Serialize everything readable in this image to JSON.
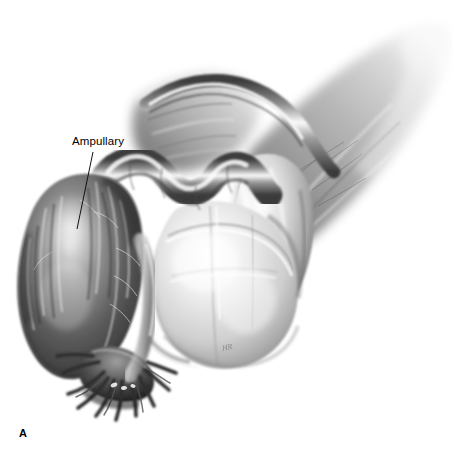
{
  "figure": {
    "panel_letter": "A",
    "medium": "grayscale-pencil-illustration",
    "background_color": "#ffffff",
    "width": 452,
    "height": 470
  },
  "labels": [
    {
      "id": "ampullary",
      "text": "Ampullary",
      "x": 72,
      "y": 136,
      "leader_from": [
        93,
        152
      ],
      "leader_to": [
        77,
        229
      ]
    }
  ],
  "signature": {
    "text": "HR",
    "visible": true
  },
  "anatomy": {
    "structures": [
      {
        "name": "ampullary-segment",
        "tone": "dark",
        "description": "distended dark fallopian tube ampulla at left"
      },
      {
        "name": "fimbriae",
        "tone": "dark",
        "description": "finger-like projections at lower left"
      },
      {
        "name": "isthmus",
        "tone": "mid",
        "description": "convoluted tubal segments across the top center"
      },
      {
        "name": "uterus",
        "tone": "light",
        "description": "pale uterine body in center"
      },
      {
        "name": "ovary",
        "tone": "mid",
        "description": "rounded body right of uterus"
      },
      {
        "name": "broad-ligament",
        "tone": "soft",
        "description": "feathered membrane fanning to upper right"
      }
    ]
  },
  "palette": {
    "darkest": "#2e2e2e",
    "dark": "#4a4a4a",
    "mid": "#8a8a8a",
    "light": "#c9c9c9",
    "highlight": "#f2f2f2",
    "background": "#ffffff",
    "ink": "#000000"
  }
}
